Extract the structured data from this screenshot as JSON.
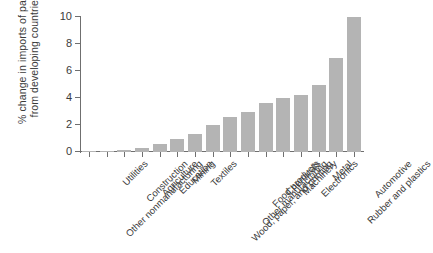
{
  "chart_data": {
    "type": "bar",
    "title": "",
    "subtitle": "",
    "xlabel": "",
    "ylabel": "% change in imports of parts from developing countries",
    "ylabel_lines": [
      "% change in imports of parts",
      "from developing countries"
    ],
    "ylim": [
      0,
      10
    ],
    "yticks": [
      0,
      2,
      4,
      6,
      8,
      10
    ],
    "ytick_labels": [
      "0",
      "2",
      "4",
      "6",
      "8",
      "10"
    ],
    "grid": false,
    "legend": false,
    "legend_position": "none",
    "bar_color": "#b4b4b4",
    "axis_color": "#6f6f6f",
    "text_color": "#3b3b3b",
    "categories": [
      "Other nonmanufacturing",
      "Utilities",
      "Construction",
      "Agriculture",
      "Education",
      "Mining",
      "Textiles",
      "Wood, paper, and printing",
      "Other manufacturing",
      "Food products",
      "Chemicals",
      "Machinery",
      "Electronics",
      "Metal",
      "Rubber and plastics",
      "Automotive"
    ],
    "values": [
      0.05,
      0.1,
      0.15,
      0.3,
      0.6,
      1.0,
      1.3,
      2.0,
      2.6,
      3.0,
      3.6,
      4.0,
      4.2,
      5.0,
      7.0,
      10.0
    ]
  }
}
